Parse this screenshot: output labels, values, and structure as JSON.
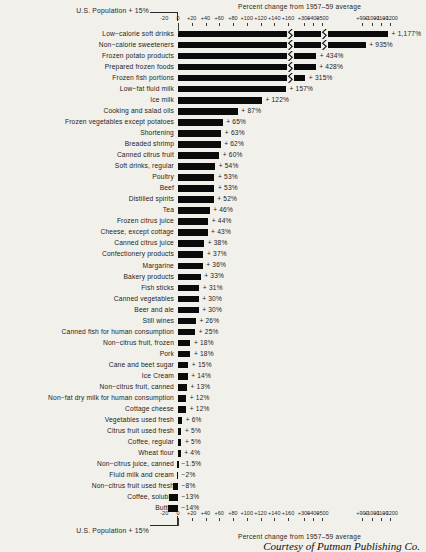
{
  "header": {
    "title_top": "Percent change from 1957–59 average",
    "title_bottom": "Percent change from 1957–59 average",
    "us_population_top": "U.S. Population + 15%",
    "us_population_bottom": "U.S. Population + 15%",
    "credit": "Courtesy of Putman Publishing Co."
  },
  "chart_data": {
    "type": "bar",
    "orientation": "horizontal",
    "xlabel": "Percent change from 1957-59 average",
    "ylabel": "",
    "grid": false,
    "legend": "none",
    "reference": {
      "label": "U.S. Population + 15%",
      "value": 15
    },
    "axis_ticks": [
      "-20",
      "0",
      "+20",
      "+40",
      "+60",
      "+80",
      "+100",
      "+120",
      "+140",
      "+160",
      "+300",
      "+400",
      "+500",
      "+900",
      "+1000",
      "+1100",
      "+1200"
    ],
    "axis_tick_values": [
      -20,
      0,
      20,
      40,
      60,
      80,
      100,
      120,
      140,
      160,
      300,
      400,
      500,
      900,
      1000,
      1100,
      1200
    ],
    "axis_breaks": [
      "after +160",
      "after +500"
    ],
    "categories": [
      "Low−calorie soft drinks",
      "Non−calorie sweeteners",
      "Frozen potato products",
      "Prepared frozen foods",
      "Frozen fish portions",
      "Low−fat fluid milk",
      "Ice milk",
      "Cooking and salad oils",
      "Frozen vegetables except potatoes",
      "Shortening",
      "Breaded shrimp",
      "Canned citrus fruit",
      "Soft drinks, regular",
      "Poultry",
      "Beef",
      "Distilled spirits",
      "Tea",
      "Frozen citrus juice",
      "Cheese, except cottage",
      "Canned citrus juice",
      "Confectionery products",
      "Margarine",
      "Bakery products",
      "Fish sticks",
      "Canned vegetables",
      "Beer and ale",
      "Still wines",
      "Canned fish for human consumption",
      "Non−citrus fruit, frozen",
      "Pork",
      "Cane and beet sugar",
      "Ice Cream",
      "Non−citrus fruit, canned",
      "Non−fat dry milk for human consumption",
      "Cottage cheese",
      "Vegetables used fresh",
      "Citrus fruit used fresh",
      "Coffee, regular",
      "Wheat flour",
      "Non−citrus juice, canned",
      "Fluid milk and cream",
      "Non−citrus fruit used fresh",
      "Coffee, soluble",
      "Butter"
    ],
    "values": [
      1177,
      935,
      434,
      428,
      315,
      157,
      122,
      87,
      65,
      63,
      62,
      60,
      54,
      53,
      53,
      52,
      46,
      44,
      43,
      38,
      37,
      36,
      33,
      31,
      30,
      30,
      26,
      25,
      18,
      18,
      15,
      14,
      13,
      12,
      12,
      6,
      5,
      5,
      4,
      -1.5,
      -2,
      -8,
      -13,
      -14
    ],
    "value_labels": [
      "+ 1,177%",
      "+ 935%",
      "+ 434%",
      "+ 428%",
      "+ 315%",
      "+ 157%",
      "+ 122%",
      "+ 87%",
      "+ 65%",
      "+ 63%",
      "+ 62%",
      "+ 60%",
      "+ 54%",
      "+ 53%",
      "+ 53%",
      "+ 52%",
      "+ 46%",
      "+ 44%",
      "+ 43%",
      "+ 38%",
      "+ 37%",
      "+ 36%",
      "+ 33%",
      "+ 31%",
      "+ 30%",
      "+ 30%",
      "+ 26%",
      "+ 25%",
      "+ 18%",
      "+ 18%",
      "+ 15%",
      "+ 14%",
      "+ 13%",
      "+ 12%",
      "+ 12%",
      "+ 6%",
      "+ 5%",
      "+ 5%",
      "+ 4%",
      "−1.5%",
      "−2%",
      "−8%",
      "−13%",
      "−14%"
    ]
  }
}
